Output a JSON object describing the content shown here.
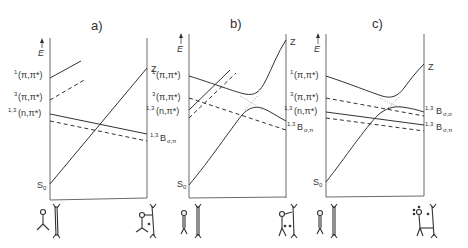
{
  "panels": [
    {
      "id": "a",
      "title": "a)",
      "axis_label": "E",
      "left_labels": [
        "(π,π*)",
        "(π,π*)",
        "(n,π*)",
        "S"
      ],
      "left_label_sups": [
        "1",
        "3",
        "1,3",
        ""
      ],
      "left_label_subs": [
        "",
        "",
        "",
        "0"
      ],
      "right_labels": [
        "Z",
        "B"
      ],
      "right_label_sups": [
        "",
        "1,3"
      ],
      "right_label_subs": [
        "",
        "σ,π"
      ]
    },
    {
      "id": "b",
      "title": "b)",
      "axis_label": "E",
      "left_labels": [
        "(π,π*)",
        "(π,π*)",
        "(n,π*)",
        "S"
      ],
      "left_label_sups": [
        "1",
        "3",
        "1,3",
        ""
      ],
      "left_label_subs": [
        "",
        "",
        "",
        "0"
      ],
      "right_labels": [
        "Z",
        "B"
      ],
      "right_label_sups": [
        "",
        "1,3"
      ],
      "right_label_subs": [
        "",
        "σ,π"
      ]
    },
    {
      "id": "c",
      "title": "c)",
      "axis_label": "E",
      "left_labels": [
        "(π,π*)",
        "(π,π*)",
        "(n,π*)",
        "S"
      ],
      "left_label_sups": [
        "1",
        "3",
        "1,3",
        ""
      ],
      "left_label_subs": [
        "",
        "",
        "",
        "0"
      ],
      "right_labels": [
        "Z",
        "B",
        "B"
      ],
      "right_label_sups": [
        "",
        "1,3",
        "1,3"
      ],
      "right_label_subs": [
        "",
        "σ,σ",
        "σ,π"
      ]
    }
  ],
  "molecules": {
    "reactant": "carbonyl + alkene",
    "product_a": "oxetane biradical (C–C bond)",
    "product_b": "oxetane biradical (C–O bond)",
    "product_c": "oxetane biradical (O radical)"
  }
}
